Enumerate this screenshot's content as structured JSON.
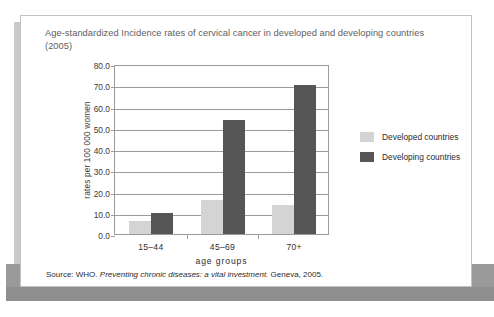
{
  "figure": {
    "title": "Age-standardized Incidence rates of cervical cancer in developed and developing countries (2005)",
    "source_prefix": "Source: WHO.",
    "source_italic": "Preventing chronic diseases: a vital investment.",
    "source_suffix": "Geneva, 2005."
  },
  "colors": {
    "developed": "#d4d4d4",
    "developing": "#565656",
    "axis": "#9b9b9b",
    "title_text": "#5e5e5e",
    "body_text": "#2b2b2b",
    "page_band": "#8e8e8e"
  },
  "chart_data": {
    "type": "bar",
    "title": "Age-standardized Incidence rates of cervical cancer in developed and developing countries (2005)",
    "xlabel": "age groups",
    "ylabel": "rates per 100 000 women",
    "categories": [
      "15–44",
      "45–69",
      "70+"
    ],
    "ylim": [
      0,
      80
    ],
    "yticks": [
      0,
      10,
      20,
      30,
      40,
      50,
      60,
      70,
      80
    ],
    "ytick_labels": [
      "0.0",
      "10.0",
      "20.0",
      "30.0",
      "40.0",
      "50.0",
      "60.0",
      "70.0",
      "80.0"
    ],
    "grid": true,
    "legend_position": "right",
    "series": [
      {
        "name": "Developed countries",
        "color": "#d4d4d4",
        "values": [
          6.0,
          16.0,
          13.5
        ]
      },
      {
        "name": "Developing countries",
        "color": "#565656",
        "values": [
          10.0,
          53.5,
          70.0
        ]
      }
    ]
  }
}
